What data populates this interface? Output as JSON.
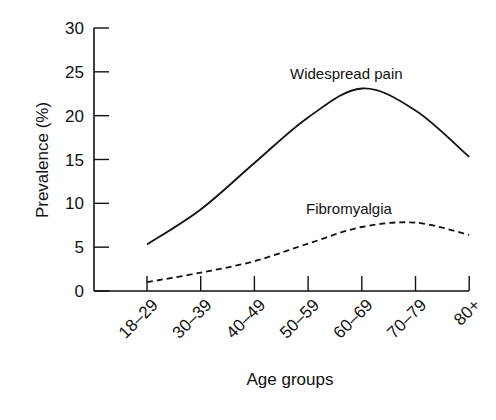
{
  "chart_data": {
    "type": "line",
    "title": "",
    "xlabel": "Age groups",
    "ylabel": "Prevalence (%)",
    "categories": [
      "18–29",
      "30–39",
      "40–49",
      "50–59",
      "60–69",
      "70–79",
      "80+"
    ],
    "yticks": [
      "0",
      "5",
      "10",
      "15",
      "20",
      "25",
      "30"
    ],
    "ylim": [
      0,
      30
    ],
    "grid": false,
    "legend": "inline labels",
    "series": [
      {
        "name": "Widespread pain",
        "style": "solid",
        "values": [
          5.3,
          9.3,
          14.6,
          19.8,
          23.1,
          20.6,
          15.3
        ]
      },
      {
        "name": "Fibromyalgia",
        "style": "dashed",
        "values": [
          1.0,
          2.1,
          3.4,
          5.4,
          7.3,
          7.8,
          6.4
        ]
      }
    ]
  }
}
